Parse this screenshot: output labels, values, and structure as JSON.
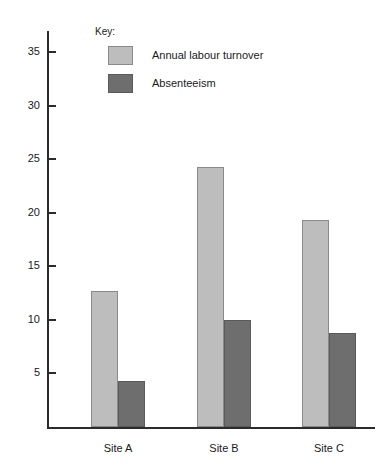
{
  "chart_data": {
    "type": "bar",
    "title": "",
    "xlabel": "",
    "ylabel": "",
    "categories": [
      "Site A",
      "Site B",
      "Site C"
    ],
    "series": [
      {
        "name": "Annual labour turnover",
        "values": [
          12.7,
          24.3,
          19.3
        ],
        "color": "#bdbdbd"
      },
      {
        "name": "Absenteeism",
        "values": [
          4.3,
          10.0,
          8.8
        ],
        "color": "#6e6e6e"
      }
    ],
    "ylim": [
      0,
      37
    ],
    "yticks": [
      5,
      10,
      15,
      20,
      25,
      30,
      35
    ],
    "grid": false,
    "legend_position": "top-left-inside"
  },
  "legend": {
    "title": "Key:",
    "entries": [
      {
        "label": "Annual labour turnover"
      },
      {
        "label": "Absenteeism"
      }
    ]
  },
  "axis": {
    "tick_labels": [
      "5",
      "10",
      "15",
      "20",
      "25",
      "30",
      "35"
    ],
    "category_labels": [
      "Site A",
      "Site B",
      "Site C"
    ]
  },
  "colors": {
    "series_light": "#bdbdbd",
    "series_dark": "#6e6e6e",
    "axis": "#2b2b2b",
    "text": "#1a1a1a",
    "background": "#ffffff"
  }
}
